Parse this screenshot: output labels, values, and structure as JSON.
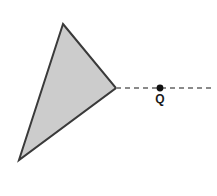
{
  "figure": {
    "type": "geometry-diagram",
    "canvas": {
      "width": 217,
      "height": 196,
      "background": "#ffffff"
    },
    "shapes": {
      "triangle": {
        "name": "shaded-triangle",
        "points_attr": "63,24 116,88 19,160",
        "vertices": [
          {
            "x": 63,
            "y": 24
          },
          {
            "x": 116,
            "y": 88
          },
          {
            "x": 19,
            "y": 160
          }
        ],
        "fill": "#cccccc",
        "stroke": "#3a3a3a",
        "stroke_width": 2
      },
      "ray": {
        "name": "dashed-ray",
        "x1": 116,
        "y1": 88,
        "x2": 214,
        "y2": 88,
        "stroke": "#8a8a8a",
        "stroke_width": 2,
        "dash_pattern": "5 4"
      },
      "point_q": {
        "name": "point-q",
        "cx": 160,
        "cy": 88,
        "r": 3.4,
        "fill": "#111111"
      }
    },
    "labels": {
      "q": {
        "text": "Q",
        "x": 160,
        "y": 93,
        "color": "#1a1a1a",
        "font_size": 12,
        "bold": true
      }
    }
  }
}
